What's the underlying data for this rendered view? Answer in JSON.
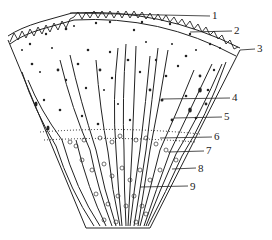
{
  "figure": {
    "type": "anatomical cross-section wedge (stem/tissue segment)",
    "stroke_color": "#222222",
    "background": "#ffffff",
    "labels": [
      {
        "num": "1",
        "x": 212,
        "y": 13,
        "line_from": [
          70,
          13
        ]
      },
      {
        "num": "2",
        "x": 234,
        "y": 28,
        "line_from": [
          190,
          32
        ]
      },
      {
        "num": "3",
        "x": 257,
        "y": 46,
        "line_from": [
          240,
          50
        ]
      },
      {
        "num": "4",
        "x": 232,
        "y": 95,
        "line_from": [
          162,
          99
        ]
      },
      {
        "num": "5",
        "x": 224,
        "y": 114,
        "line_from": [
          174,
          118
        ]
      },
      {
        "num": "6",
        "x": 214,
        "y": 133,
        "line_from": [
          160,
          138
        ]
      },
      {
        "num": "7",
        "x": 206,
        "y": 147,
        "line_from": [
          168,
          152
        ]
      },
      {
        "num": "8",
        "x": 198,
        "y": 165,
        "line_from": [
          172,
          169
        ]
      },
      {
        "num": "9",
        "x": 190,
        "y": 183,
        "line_from": [
          140,
          187
        ]
      }
    ]
  }
}
